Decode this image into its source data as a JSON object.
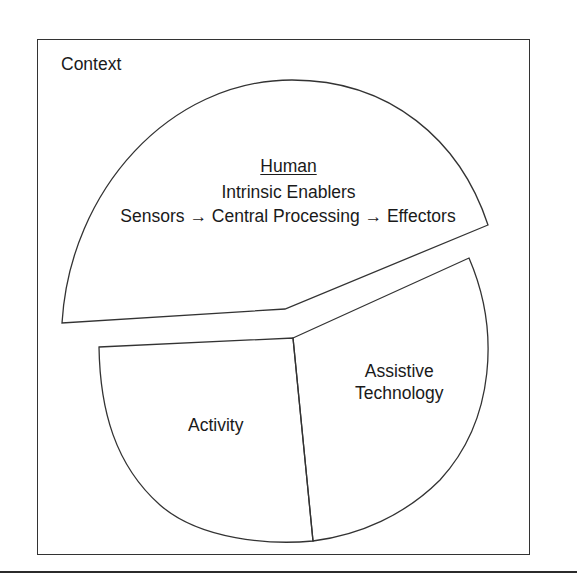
{
  "diagram": {
    "context_label": "Context",
    "human": {
      "title": "Human",
      "subtitle": "Intrinsic Enablers",
      "chain": {
        "sensors": "Sensors",
        "arrow1": "→",
        "central": "Central Processing",
        "arrow2": "→",
        "effectors": "Effectors"
      }
    },
    "activity_label": "Activity",
    "assistive_technology": {
      "line1": "Assistive",
      "line2": "Technology"
    },
    "colors": {
      "stroke": "#333333",
      "background": "#ffffff",
      "text": "#1a1a1a"
    }
  }
}
